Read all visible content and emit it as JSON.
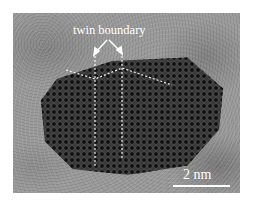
{
  "figure": {
    "type": "HRTEM micrograph",
    "annotation_label": "twin boundary",
    "scale_bar": {
      "label": "2 nm",
      "color": "#ffffff"
    },
    "colors": {
      "background": "#9a9a9a",
      "particle": "#3a3a3a",
      "annotation": "#ffffff"
    }
  }
}
